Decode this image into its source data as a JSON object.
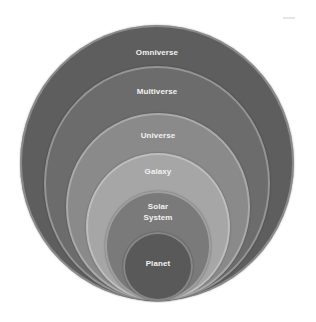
{
  "diagram": {
    "title": "",
    "type": "nested-circles",
    "levels": [
      {
        "label": "Omniverse",
        "color": "#5e5e5e"
      },
      {
        "label": "Multiverse",
        "color": "#6c6c6c"
      },
      {
        "label": "Universe",
        "color": "#8a8a8a"
      },
      {
        "label": "Galaxy",
        "color": "#a6a6a6"
      },
      {
        "label": "Solar\nSystem",
        "color": "#7a7a7a"
      },
      {
        "label": "Planet",
        "color": "#595959"
      }
    ]
  }
}
